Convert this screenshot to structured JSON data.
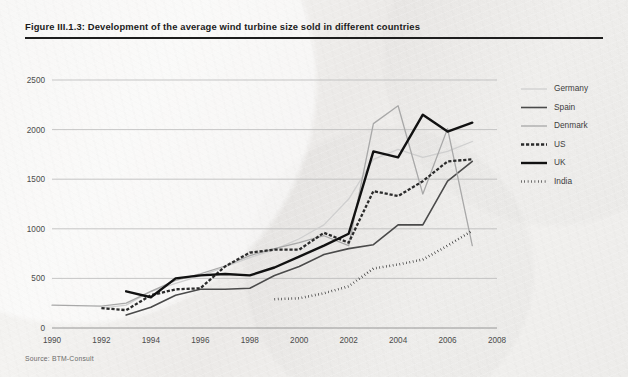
{
  "figure": {
    "title": "Figure III.1.3: Development of the average wind turbine size sold in different countries",
    "source": "Source: BTM-Consult"
  },
  "chart_data": {
    "type": "line",
    "title": "Development of the average wind turbine size sold in different countries",
    "xlabel": "",
    "ylabel": "",
    "xlim": [
      1990,
      2008
    ],
    "ylim": [
      0,
      2500
    ],
    "xticks": [
      1990,
      1992,
      1994,
      1996,
      1998,
      2000,
      2002,
      2004,
      2006,
      2008
    ],
    "yticks": [
      0,
      500,
      1000,
      1500,
      2000,
      2500
    ],
    "grid": "horizontal",
    "legend_position": "right",
    "series": [
      {
        "name": "Germany",
        "color": "#cfcfcf",
        "style": "solid-thin",
        "x": [
          1992,
          1993,
          1994,
          1995,
          1996,
          1997,
          1998,
          1999,
          2000,
          2001,
          2002,
          2003,
          2004,
          2005,
          2006,
          2007
        ],
        "values": [
          200,
          230,
          370,
          450,
          525,
          615,
          710,
          790,
          900,
          1040,
          1300,
          1700,
          1800,
          1720,
          1780,
          1880
        ]
      },
      {
        "name": "Spain",
        "color": "#4a4a4a",
        "style": "solid-medium",
        "x": [
          1993,
          1994,
          1995,
          1996,
          1997,
          1998,
          1999,
          2000,
          2001,
          2002,
          2003,
          2004,
          2005,
          2006,
          2007
        ],
        "values": [
          130,
          210,
          330,
          390,
          390,
          400,
          530,
          620,
          740,
          800,
          840,
          1040,
          1040,
          1480,
          1680
        ]
      },
      {
        "name": "Denmark",
        "color": "#a8a8a8",
        "style": "solid-thin",
        "x": [
          1990,
          1991,
          1992,
          1993,
          1994,
          1995,
          1996,
          1997,
          1998,
          1999,
          2000,
          2001,
          2002,
          2003,
          2004,
          2005,
          2006,
          2007
        ],
        "values": [
          230,
          225,
          220,
          250,
          370,
          480,
          545,
          625,
          730,
          800,
          860,
          930,
          830,
          2060,
          2240,
          1350,
          2010,
          830
        ]
      },
      {
        "name": "US",
        "color": "#2b2b2b",
        "style": "dashed-thick",
        "x": [
          1992,
          1993,
          1994,
          1995,
          1996,
          1997,
          1998,
          1999,
          2000,
          2001,
          2002,
          2003,
          2004,
          2005,
          2006,
          2007
        ],
        "values": [
          200,
          180,
          330,
          390,
          400,
          620,
          760,
          790,
          790,
          960,
          860,
          1380,
          1330,
          1480,
          1680,
          1700
        ]
      },
      {
        "name": "UK",
        "color": "#111111",
        "style": "solid-thick",
        "x": [
          1993,
          1994,
          1995,
          1996,
          1997,
          1998,
          1999,
          2000,
          2001,
          2002,
          2003,
          2004,
          2005,
          2006,
          2007
        ],
        "values": [
          370,
          310,
          500,
          530,
          545,
          530,
          610,
          720,
          830,
          950,
          1780,
          1720,
          2150,
          1980,
          2070
        ]
      },
      {
        "name": "India",
        "color": "#1a1a1a",
        "style": "dotted",
        "x": [
          1999,
          2000,
          2001,
          2002,
          2003,
          2004,
          2005,
          2006,
          2007
        ],
        "values": [
          290,
          300,
          350,
          420,
          600,
          640,
          690,
          830,
          980
        ]
      }
    ]
  },
  "legend": {
    "entries": [
      {
        "label": "Germany"
      },
      {
        "label": "Spain"
      },
      {
        "label": "Denmark"
      },
      {
        "label": "US"
      },
      {
        "label": "UK"
      },
      {
        "label": "India"
      }
    ]
  }
}
